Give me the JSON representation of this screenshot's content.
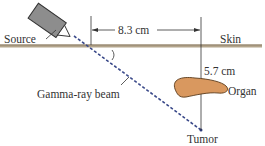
{
  "labels": {
    "source": "Source",
    "skin": "Skin",
    "distance": "8.3 cm",
    "depth": "5.7 cm",
    "organ": "Organ",
    "beam": "Gamma-ray beam",
    "tumor": "Tumor"
  },
  "colors": {
    "skin_line": "#a99a80",
    "beam": "#3b4a8a",
    "organ_fill": "#d9985f",
    "source_fill": "#8a8a8a"
  }
}
